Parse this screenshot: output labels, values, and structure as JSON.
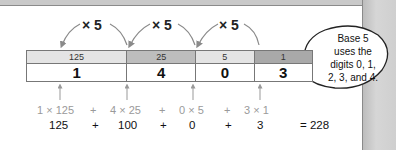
{
  "diagram": {
    "multipliers": [
      "× 5",
      "× 5",
      "× 5"
    ],
    "place_values": [
      {
        "value": "125",
        "color": "#e4e4e4"
      },
      {
        "value": "25",
        "color": "#bdbdbd"
      },
      {
        "value": "5",
        "color": "#e4e4e4"
      },
      {
        "value": "1",
        "color": "#a9a9a9"
      }
    ],
    "digits": [
      "1",
      "4",
      "0",
      "3"
    ],
    "expansion": [
      "1 × 125",
      "+",
      "4 × 25",
      "+",
      "0 × 5",
      "+",
      "3 × 1"
    ],
    "products": [
      "125",
      "+",
      "100",
      "+",
      "0",
      "+",
      "3"
    ],
    "result": "= 228",
    "callout": {
      "lines": [
        "Base 5",
        "uses the",
        "digits 0, 1,",
        "2, 3, and 4."
      ]
    }
  }
}
